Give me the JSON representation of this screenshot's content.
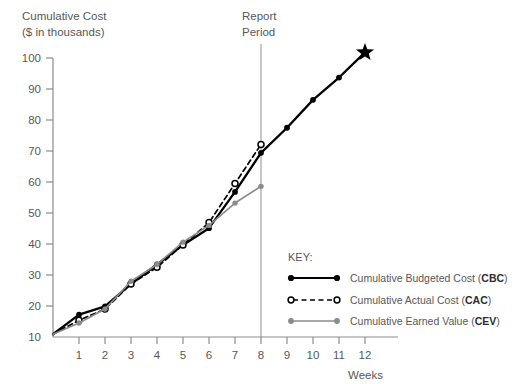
{
  "chart_data": {
    "type": "line",
    "title": "",
    "ylabel_line1": "Cumulative Cost",
    "ylabel_line2": "($ in thousands)",
    "xlabel": "Weeks",
    "x": [
      0,
      1,
      2,
      3,
      4,
      5,
      6,
      7,
      8,
      9,
      10,
      11,
      12
    ],
    "xticks": [
      1,
      2,
      3,
      4,
      5,
      6,
      7,
      8,
      9,
      10,
      11,
      12
    ],
    "yticks": [
      10,
      20,
      30,
      40,
      50,
      60,
      70,
      80,
      90,
      100
    ],
    "xlim": [
      0,
      12
    ],
    "ylim": [
      0,
      104
    ],
    "grid": false,
    "legend_position": "inside-lower-right",
    "annotations": [
      {
        "name": "report-period",
        "label_line1": "Report",
        "label_line2": "Period",
        "x": 8,
        "type": "vertical-line"
      }
    ],
    "series": [
      {
        "name": "Cumulative Budgeted Cost (CBC)",
        "abbr": "CBC",
        "color": "#000000",
        "style": "solid",
        "marker": "filled-circle",
        "x": [
          0,
          1,
          2,
          3,
          4,
          5,
          6,
          7,
          8,
          9,
          10,
          11,
          12
        ],
        "values": [
          1,
          8,
          11,
          19,
          26,
          33,
          39,
          52,
          66,
          75,
          85,
          93,
          102
        ],
        "end_marker": "star",
        "end_marker_x": 12,
        "end_marker_y": 102
      },
      {
        "name": "Cumulative Actual Cost (CAC)",
        "abbr": "CAC",
        "color": "#000000",
        "style": "dashed",
        "marker": "open-circle",
        "x": [
          0,
          1,
          2,
          3,
          4,
          5,
          6,
          7,
          8
        ],
        "values": [
          1,
          6,
          10,
          19,
          25,
          33,
          41,
          55,
          69
        ]
      },
      {
        "name": "Cumulative Earned Value (CEV)",
        "abbr": "CEV",
        "color": "#8c8c8e",
        "style": "solid",
        "marker": "filled-circle",
        "x": [
          0,
          1,
          2,
          3,
          4,
          5,
          6,
          7,
          8
        ],
        "values": [
          1,
          5,
          10,
          20,
          26,
          34,
          40,
          48,
          54
        ]
      }
    ]
  },
  "key": {
    "title": "KEY:",
    "entries": [
      {
        "prefix": "Cumulative Budgeted Cost (",
        "abbr": "CBC",
        "suffix": ")",
        "swatch": "solid-black-filled-dots"
      },
      {
        "prefix": "Cumulative Actual Cost (",
        "abbr": "CAC",
        "suffix": ")",
        "swatch": "dashed-black-open-dots"
      },
      {
        "prefix": "Cumulative Earned Value (",
        "abbr": "CEV",
        "suffix": ")",
        "swatch": "solid-gray-filled-dots"
      }
    ]
  },
  "axes": {
    "y_labels": [
      "100",
      "90",
      "80",
      "70",
      "60",
      "50",
      "40",
      "30",
      "20",
      "10"
    ],
    "x_labels": [
      "1",
      "2",
      "3",
      "4",
      "5",
      "6",
      "7",
      "8",
      "9",
      "10",
      "11",
      "12"
    ]
  },
  "colors": {
    "text": "#58585a",
    "axis": "#8c8c8e",
    "cbc": "#000000",
    "cac": "#000000",
    "cev": "#8c8c8e",
    "report_line": "#9a9a9c"
  }
}
